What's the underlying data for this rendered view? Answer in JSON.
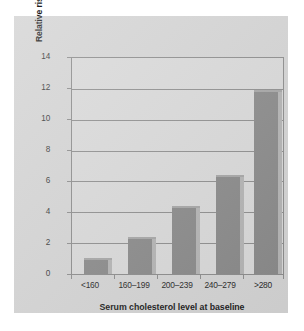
{
  "chart_data": {
    "type": "bar",
    "title": "",
    "subtitle": "",
    "categories": [
      "<160",
      "160–199",
      "200–239",
      "240–279",
      ">280"
    ],
    "values": [
      0.9,
      2.3,
      4.25,
      6.3,
      11.8
    ],
    "series": [
      {
        "name": "Relative risk of mortality due to coronary disease",
        "values": [
          0.9,
          2.3,
          4.25,
          6.3,
          11.8
        ]
      }
    ],
    "xlabel": "Serum cholesterol level at baseline",
    "ylabel": "Relative risk of mortality due to coronary disease",
    "ylim": [
      0,
      14
    ],
    "yticks": [
      0,
      2,
      4,
      6,
      8,
      10,
      12,
      14
    ],
    "ytick_labels": [
      "0",
      "2",
      "4",
      "6",
      "8",
      "10",
      "12",
      "14"
    ],
    "grid": "horizontal",
    "legend": "none",
    "annotations": [],
    "colors": {
      "bar_face": "#8a8a8a",
      "bar_side": "#b4b4b4",
      "plot_background": "#d9d9d9",
      "figure_background": "#d4d4d4",
      "gridline": "#8e8e8e",
      "axis_frame": "#8c8c8c",
      "text": "#1c1c1c"
    }
  }
}
